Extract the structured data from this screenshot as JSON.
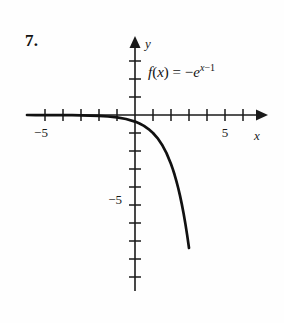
{
  "problem": {
    "number": "7."
  },
  "formula": {
    "lhs": "f",
    "lparen": "(",
    "var": "x",
    "rparen": ")",
    "equals": "=",
    "minus": "−",
    "base": "e",
    "exp_var": "x",
    "exp_minus": "−",
    "exp_const": "1",
    "plain": "f(x) = −e^(x−1)"
  },
  "axes": {
    "x_label": "x",
    "y_label": "y",
    "x_tick_labels": [
      {
        "text": "−5",
        "value": -5
      },
      {
        "text": "5",
        "value": 5
      }
    ],
    "y_tick_labels": [
      {
        "text": "−5",
        "value": -5
      }
    ],
    "axis_color": "#1a1a1a",
    "curve_color": "#111111"
  },
  "chart_data": {
    "type": "line",
    "title": "",
    "subtitle": "",
    "xlabel": "x",
    "ylabel": "y",
    "function": "f(x) = -e^(x-1)",
    "xlim": [
      -6.2,
      7.1
    ],
    "ylim": [
      -9.5,
      4.3
    ],
    "x_ticks": [
      -6,
      -5,
      -4,
      -3,
      -2,
      -1,
      1,
      2,
      3,
      4,
      5,
      6
    ],
    "y_ticks": [
      -9,
      -8,
      -7,
      -6,
      -5,
      -4,
      -3,
      -2,
      -1,
      1,
      2,
      3
    ],
    "x_tick_labeled": [
      -5,
      5
    ],
    "y_tick_labeled": [
      -5
    ],
    "grid": false,
    "legend": false,
    "units_per_tick": 1,
    "series": [
      {
        "name": "f(x) = -e^(x-1)",
        "x": [
          -6.0,
          -5.5,
          -5.0,
          -4.5,
          -4.0,
          -3.5,
          -3.0,
          -2.5,
          -2.0,
          -1.5,
          -1.0,
          -0.5,
          0.0,
          0.25,
          0.5,
          0.75,
          1.0,
          1.25,
          1.5,
          1.75,
          2.0,
          2.1,
          2.2,
          2.3,
          2.4,
          2.5,
          2.6,
          2.7,
          2.8,
          2.9,
          3.0
        ],
        "y": [
          -0.001,
          -0.0014,
          -0.0025,
          -0.004,
          -0.0067,
          -0.0111,
          -0.0183,
          -0.0302,
          -0.0498,
          -0.0821,
          -0.1353,
          -0.2231,
          -0.3679,
          -0.4724,
          -0.6065,
          -0.7788,
          -1.0,
          -1.284,
          -1.6487,
          -2.117,
          -2.7183,
          -3.0042,
          -3.3201,
          -3.6693,
          -4.0552,
          -4.4817,
          -4.953,
          -5.4739,
          -6.0496,
          -6.6859,
          -7.3891
        ]
      }
    ],
    "annotations": [
      {
        "text": "f(x) = −e^(x−1)",
        "x": 1.0,
        "y": 2.6
      }
    ]
  }
}
